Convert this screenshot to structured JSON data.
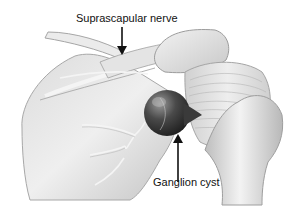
{
  "figure": {
    "labels": [
      {
        "id": "suprascapular-nerve",
        "text": "Suprascapular nerve",
        "arrow": "down"
      },
      {
        "id": "ganglion-cyst",
        "text": "Ganglion cyst",
        "arrow": "up"
      }
    ],
    "colors": {
      "background": "#ffffff",
      "bone_light": "#e6e6e6",
      "bone_mid": "#c9c9c9",
      "bone_dark": "#9a9a9a",
      "cyst_dark": "#2f2f2f",
      "nerve": "#f4f4f4",
      "text": "#111111",
      "arrow": "#111111"
    }
  }
}
